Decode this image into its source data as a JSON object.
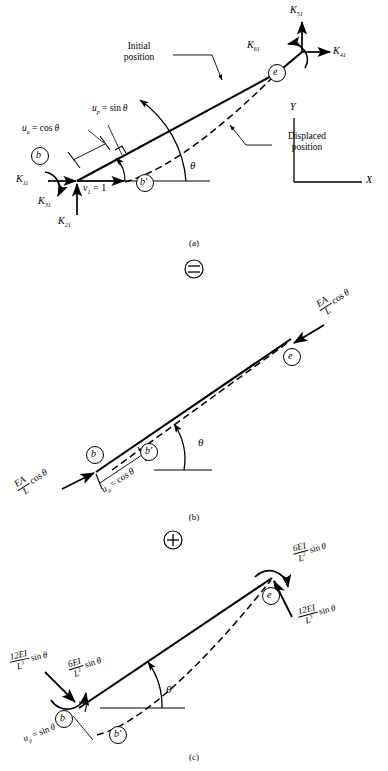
{
  "figure": {
    "panels": [
      "(a)",
      "(b)",
      "(c)"
    ],
    "operators": [
      "=",
      "+"
    ],
    "theta": "θ"
  },
  "panel_a": {
    "caption": "(a)",
    "nodes": [
      {
        "name": "node-b",
        "label": "b"
      },
      {
        "name": "node-b-prime",
        "label": "b′"
      },
      {
        "name": "node-e",
        "label": "e"
      }
    ],
    "forces": [
      {
        "name": "K11",
        "base": "K",
        "sub": "11",
        "dir": "left-horizontal"
      },
      {
        "name": "K21",
        "base": "K",
        "sub": "21",
        "dir": "up-vertical"
      },
      {
        "name": "K31",
        "base": "K",
        "sub": "31",
        "dir": "moment"
      },
      {
        "name": "K41",
        "base": "K",
        "sub": "41",
        "dir": "right-horizontal"
      },
      {
        "name": "K51",
        "base": "K",
        "sub": "51",
        "dir": "up-vertical"
      },
      {
        "name": "K61",
        "base": "K",
        "sub": "61",
        "dir": "moment"
      }
    ],
    "unit_displacement": {
      "base": "v",
      "sub": "1",
      "eq": "= 1"
    },
    "components": [
      {
        "base": "u",
        "sub": "a",
        "eq": "= cos θ"
      },
      {
        "base": "u",
        "sub": "p",
        "eq": "= sin θ"
      }
    ],
    "annotations": [
      {
        "name": "initial-position",
        "line1": "Initial",
        "line2": "position"
      },
      {
        "name": "displaced-position",
        "line1": "Displaced",
        "line2": "position"
      }
    ],
    "axes": {
      "x": "X",
      "y": "Y"
    },
    "angle": "θ"
  },
  "panel_b": {
    "caption": "(b)",
    "nodes": [
      {
        "name": "node-b",
        "label": "b"
      },
      {
        "name": "node-b-prime",
        "label": "b′"
      },
      {
        "name": "node-e",
        "label": "e"
      }
    ],
    "forces": [
      {
        "name": "axial-force-b",
        "num": "EA",
        "den": "L",
        "trig": "cos θ"
      },
      {
        "name": "axial-force-e",
        "num": "EA",
        "den": "L",
        "trig": "cos θ"
      }
    ],
    "component": {
      "base": "u",
      "sub": "a",
      "eq": "= cos θ"
    },
    "angle": "θ"
  },
  "panel_c": {
    "caption": "(c)",
    "nodes": [
      {
        "name": "node-b",
        "label": "b"
      },
      {
        "name": "node-b-prime",
        "label": "b′"
      },
      {
        "name": "node-e",
        "label": "e"
      }
    ],
    "forces": [
      {
        "name": "shear-force-b",
        "num": "12EI",
        "den": "L",
        "exp": "3",
        "trig": "sin θ"
      },
      {
        "name": "moment-b",
        "num": "6EI",
        "den": "L",
        "exp": "2",
        "trig": "sin θ"
      },
      {
        "name": "moment-e",
        "num": "6EI",
        "den": "L",
        "exp": "2",
        "trig": "sin θ"
      },
      {
        "name": "shear-force-e",
        "num": "12EI",
        "den": "L",
        "exp": "3",
        "trig": "sin θ"
      }
    ],
    "component": {
      "base": "u",
      "sub": "p",
      "eq": "= sin θ"
    },
    "angle": "θ"
  }
}
